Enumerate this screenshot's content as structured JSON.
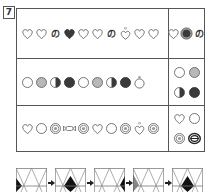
{
  "question_number": "7",
  "rows": [
    {
      "sequence": [
        "heart",
        "heart",
        "no",
        "heart-dark",
        "heart",
        "heart",
        "no",
        "heart-dot",
        "heart",
        "heart"
      ],
      "answer_layout": "single",
      "answer": [
        "heart",
        "circle-dark-ring",
        "no"
      ]
    },
    {
      "sequence": [
        "circle",
        "circle-gray",
        "circle-half",
        "circle-dark",
        "circle",
        "circle-gray",
        "circle-half",
        "circle-dark",
        "circle-dot"
      ],
      "answer_layout": "grid",
      "answer": [
        "circle",
        "circle-gray",
        "circle-half",
        "circle-dark"
      ]
    },
    {
      "sequence": [
        "heart",
        "circle",
        "spiral",
        "candy",
        "spiral",
        "heart",
        "circle",
        "spiral",
        "heart-dot",
        "spiral"
      ],
      "answer_layout": "grid",
      "answer": [
        "heart",
        "circle",
        "spiral",
        "spiral-bold"
      ]
    }
  ],
  "panels": [
    {
      "fill": "left-edge"
    },
    {
      "fill": "center"
    },
    {
      "fill": "right-edge"
    },
    {
      "fill": "left-gray"
    },
    {
      "fill": "center"
    }
  ],
  "colors": {
    "line": "#555555",
    "dark": "#3a3a3a",
    "gray": "#b8b8b8"
  }
}
